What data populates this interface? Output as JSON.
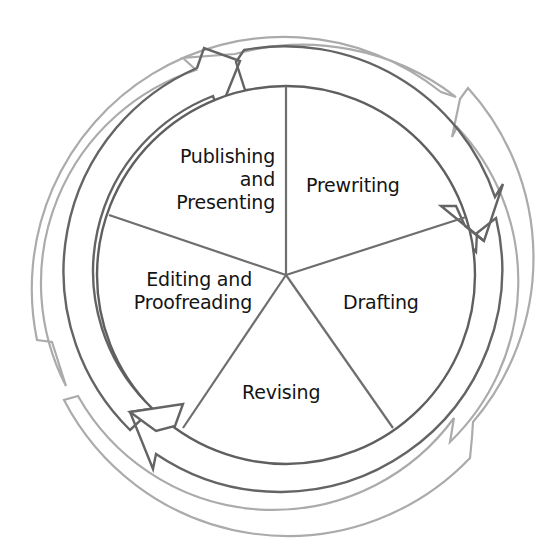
{
  "diagram": {
    "type": "cycle",
    "direction": "clockwise",
    "stages": [
      {
        "id": "prewriting",
        "lines": [
          "Prewriting"
        ]
      },
      {
        "id": "drafting",
        "lines": [
          "Drafting"
        ]
      },
      {
        "id": "revising",
        "lines": [
          "Revising"
        ]
      },
      {
        "id": "editing",
        "lines": [
          "Editing and",
          "Proofreading"
        ]
      },
      {
        "id": "publishing",
        "lines": [
          "Publishing",
          "and",
          "Presenting"
        ]
      }
    ],
    "colors": {
      "spoke": "#6e6e6e",
      "inner_ring_stroke": "#5f5f5f",
      "outer_ring_stroke": "#a9a9a9",
      "text": "#141414",
      "background": "#ffffff"
    }
  }
}
